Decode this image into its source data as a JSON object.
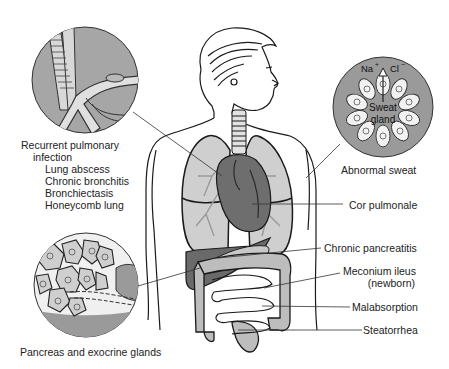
{
  "diagram": {
    "colors": {
      "organ_light": "#c8c8c8",
      "organ_mid": "#a9a9a9",
      "organ_dark": "#6e6e6e",
      "outline": "#1a1a1a",
      "inset_bg": "#9a9a9a",
      "text": "#222222"
    },
    "insets": [
      {
        "name": "airways",
        "label": "Recurrent pulmonary infection"
      },
      {
        "name": "sweat-gland",
        "label": "Abnormal sweat",
        "inner_labels": {
          "ion_left": "Na",
          "ion_left_sup": "+",
          "ion_right": "Cl",
          "ion_right_sup": "−",
          "gland_line1": "Sweat",
          "gland_line2": "gland"
        }
      },
      {
        "name": "pancreas-glands",
        "label": "Pancreas and exocrine glands"
      }
    ],
    "left_labels": {
      "title_line1": "Recurrent pulmonary",
      "title_line2": "infection",
      "items": [
        "Lung abscess",
        "Chronic bronchitis",
        "Bronchiectasis",
        "Honeycomb lung"
      ]
    },
    "right_labels": [
      {
        "text": "Abnormal sweat"
      },
      {
        "text": "Cor pulmonale"
      },
      {
        "text": "Chronic pancreatitis"
      },
      {
        "text": "Meconium ileus",
        "text2": "(newborn)"
      },
      {
        "text": "Malabsorption"
      },
      {
        "text": "Steatorrhea"
      }
    ],
    "bottom_label": "Pancreas and exocrine glands"
  }
}
